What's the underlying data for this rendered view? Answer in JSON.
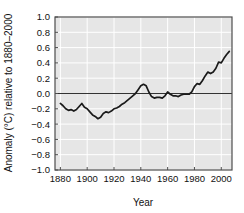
{
  "chart_data": {
    "type": "line",
    "title": "",
    "subtitle": "",
    "xlabel": "Year",
    "ylabel": "Anomaly (°C) relative to 1880–2000",
    "xlim": [
      1876,
      2008
    ],
    "ylim": [
      -1.0,
      1.0
    ],
    "xticks": [
      1880,
      1900,
      1920,
      1940,
      1960,
      1980,
      2000
    ],
    "xtick_labels": [
      "1880",
      "1900",
      "1920",
      "1940",
      "1960",
      "1980",
      "2000"
    ],
    "yticks": [
      -1.0,
      -0.8,
      -0.6,
      -0.4,
      -0.2,
      0.0,
      0.2,
      0.4,
      0.6,
      0.8,
      1.0
    ],
    "ytick_labels": [
      "−1.0",
      "−0.8",
      "−0.6",
      "−0.4",
      "−0.2",
      "0.0",
      "0.2",
      "0.4",
      "0.6",
      "0.8",
      "1.0"
    ],
    "grid": true,
    "grid_color": "#ffffff",
    "plot_background": "#e6e6e6",
    "line_color": "#1a1a1a",
    "zero_line": true,
    "zero_line_value": 0.0,
    "legend": null,
    "legend_position": "none",
    "series": [
      {
        "name": "Global temperature anomaly",
        "x": [
          1880,
          1882,
          1884,
          1886,
          1888,
          1890,
          1892,
          1894,
          1896,
          1898,
          1900,
          1902,
          1904,
          1906,
          1908,
          1910,
          1912,
          1914,
          1916,
          1918,
          1920,
          1922,
          1924,
          1926,
          1928,
          1930,
          1932,
          1934,
          1936,
          1938,
          1940,
          1942,
          1944,
          1946,
          1948,
          1950,
          1952,
          1954,
          1956,
          1958,
          1960,
          1962,
          1964,
          1966,
          1968,
          1970,
          1972,
          1974,
          1976,
          1978,
          1980,
          1982,
          1984,
          1986,
          1988,
          1990,
          1992,
          1994,
          1996,
          1998,
          2000,
          2002,
          2004,
          2006
        ],
        "values": [
          -0.13,
          -0.16,
          -0.2,
          -0.22,
          -0.21,
          -0.23,
          -0.21,
          -0.17,
          -0.13,
          -0.18,
          -0.2,
          -0.24,
          -0.28,
          -0.3,
          -0.33,
          -0.31,
          -0.26,
          -0.24,
          -0.25,
          -0.23,
          -0.2,
          -0.19,
          -0.17,
          -0.14,
          -0.12,
          -0.09,
          -0.06,
          -0.03,
          0.0,
          0.05,
          0.1,
          0.12,
          0.1,
          0.02,
          -0.04,
          -0.06,
          -0.05,
          -0.05,
          -0.06,
          -0.03,
          0.02,
          -0.01,
          -0.03,
          -0.03,
          -0.04,
          -0.02,
          -0.01,
          -0.01,
          -0.01,
          0.02,
          0.09,
          0.13,
          0.12,
          0.17,
          0.23,
          0.28,
          0.26,
          0.28,
          0.33,
          0.41,
          0.4,
          0.46,
          0.51,
          0.55
        ]
      }
    ],
    "data_note": "Values are °C anomalies relative to the 1880–2000 mean, read from the plotted curve."
  },
  "axes": {
    "y_axis_name": "temperature-anomaly-axis",
    "x_axis_name": "year-axis"
  }
}
